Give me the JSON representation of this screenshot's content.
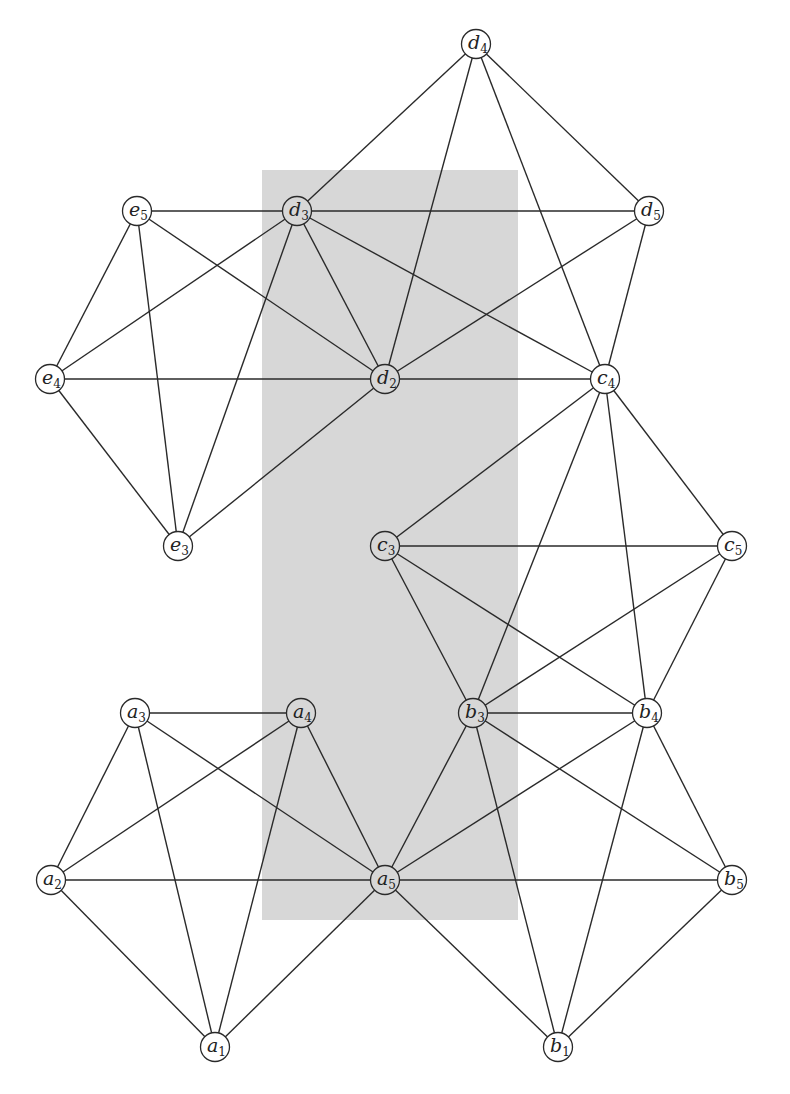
{
  "diagram": {
    "type": "graph",
    "shaded_region": {
      "x": 262,
      "y": 170,
      "width": 256,
      "height": 750,
      "color": "#d7d7d7"
    },
    "nodes": [
      {
        "id": "d4",
        "letter": "d",
        "sub": "4",
        "x": 476,
        "y": 44
      },
      {
        "id": "e5",
        "letter": "e",
        "sub": "5",
        "x": 137,
        "y": 211
      },
      {
        "id": "d3",
        "letter": "d",
        "sub": "3",
        "x": 297,
        "y": 211
      },
      {
        "id": "d5",
        "letter": "d",
        "sub": "5",
        "x": 649,
        "y": 211
      },
      {
        "id": "e4",
        "letter": "e",
        "sub": "4",
        "x": 50,
        "y": 379
      },
      {
        "id": "d2",
        "letter": "d",
        "sub": "2",
        "x": 385,
        "y": 379
      },
      {
        "id": "c4",
        "letter": "c",
        "sub": "4",
        "x": 605,
        "y": 379
      },
      {
        "id": "e3",
        "letter": "e",
        "sub": "3",
        "x": 178,
        "y": 546
      },
      {
        "id": "c3",
        "letter": "c",
        "sub": "3",
        "x": 385,
        "y": 546
      },
      {
        "id": "c5",
        "letter": "c",
        "sub": "5",
        "x": 732,
        "y": 546
      },
      {
        "id": "a3",
        "letter": "a",
        "sub": "3",
        "x": 135,
        "y": 713
      },
      {
        "id": "a4",
        "letter": "a",
        "sub": "4",
        "x": 301,
        "y": 713
      },
      {
        "id": "b3",
        "letter": "b",
        "sub": "3",
        "x": 473,
        "y": 713
      },
      {
        "id": "b4",
        "letter": "b",
        "sub": "4",
        "x": 647,
        "y": 713
      },
      {
        "id": "a2",
        "letter": "a",
        "sub": "2",
        "x": 51,
        "y": 880
      },
      {
        "id": "a5",
        "letter": "a",
        "sub": "5",
        "x": 385,
        "y": 880
      },
      {
        "id": "b5",
        "letter": "b",
        "sub": "5",
        "x": 732,
        "y": 880
      },
      {
        "id": "a1",
        "letter": "a",
        "sub": "1",
        "x": 215,
        "y": 1047
      },
      {
        "id": "b1",
        "letter": "b",
        "sub": "1",
        "x": 558,
        "y": 1047
      }
    ],
    "edges": [
      [
        "e5",
        "d3"
      ],
      [
        "e5",
        "e4"
      ],
      [
        "e5",
        "e3"
      ],
      [
        "e5",
        "d2"
      ],
      [
        "e4",
        "d3"
      ],
      [
        "e4",
        "d2"
      ],
      [
        "e4",
        "e3"
      ],
      [
        "e3",
        "d3"
      ],
      [
        "e3",
        "d2"
      ],
      [
        "d3",
        "d2"
      ],
      [
        "d4",
        "d3"
      ],
      [
        "d4",
        "d2"
      ],
      [
        "d4",
        "d5"
      ],
      [
        "d4",
        "c4"
      ],
      [
        "d3",
        "d5"
      ],
      [
        "d3",
        "c4"
      ],
      [
        "d5",
        "d2"
      ],
      [
        "d5",
        "c4"
      ],
      [
        "d2",
        "c4"
      ],
      [
        "c4",
        "c3"
      ],
      [
        "c4",
        "c5"
      ],
      [
        "c4",
        "b3"
      ],
      [
        "c4",
        "b4"
      ],
      [
        "c3",
        "c5"
      ],
      [
        "c3",
        "b3"
      ],
      [
        "c3",
        "b4"
      ],
      [
        "c5",
        "b3"
      ],
      [
        "c5",
        "b4"
      ],
      [
        "b3",
        "b4"
      ],
      [
        "a3",
        "a4"
      ],
      [
        "a3",
        "a2"
      ],
      [
        "a3",
        "a1"
      ],
      [
        "a3",
        "a5"
      ],
      [
        "a4",
        "a2"
      ],
      [
        "a4",
        "a1"
      ],
      [
        "a4",
        "a5"
      ],
      [
        "a2",
        "a5"
      ],
      [
        "a2",
        "a1"
      ],
      [
        "a1",
        "a5"
      ],
      [
        "a5",
        "b3"
      ],
      [
        "a5",
        "b4"
      ],
      [
        "a5",
        "b5"
      ],
      [
        "a5",
        "b1"
      ],
      [
        "b3",
        "b5"
      ],
      [
        "b3",
        "b1"
      ],
      [
        "b4",
        "b5"
      ],
      [
        "b4",
        "b1"
      ],
      [
        "b5",
        "b1"
      ]
    ],
    "colors": {
      "line": "#2a2a2a",
      "node_fill_outside": "#ffffff",
      "shade": "#d7d7d7"
    }
  }
}
